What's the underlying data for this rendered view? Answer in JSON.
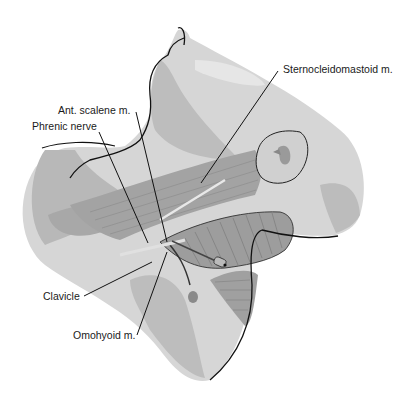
{
  "figure": {
    "colors": {
      "background": "#ffffff",
      "skin_light": "#dcdcdc",
      "skin_mid": "#c4c4c4",
      "skin_dark": "#a9a9a9",
      "muscle": "#9a9a9a",
      "muscle_dark": "#7e7e7e",
      "outline": "#111111"
    }
  },
  "labels": {
    "sternocleidomastoid": "Sternocleidomastoid m.",
    "ant_scalene": "Ant. scalene m.",
    "phrenic_nerve": "Phrenic nerve",
    "clavicle": "Clavicle",
    "omohyoid": "Omohyoid m."
  }
}
